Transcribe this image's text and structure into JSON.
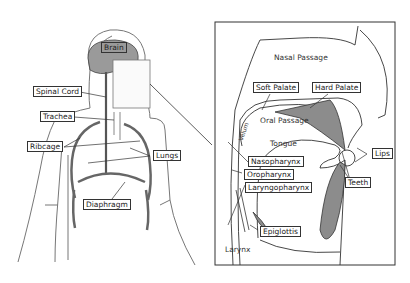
{
  "left_panel": {
    "labels": {
      "brain": "Brain",
      "spinal_cord": "Spinal Cord",
      "trachea": "Trachea",
      "ribcage": "Ribcage",
      "lungs": "Lungs",
      "diaphragm": "Diaphragm"
    }
  },
  "right_panel": {
    "labels": {
      "nasal_passage": "Nasal Passage",
      "soft_palate": "Soft Palate",
      "hard_palate": "Hard Palate",
      "velum": "Velum",
      "oral_passage": "Oral Passage",
      "tongue": "Tongue",
      "lips": "Lips",
      "nasopharynx": "Nasopharynx",
      "oropharynx": "Oropharynx",
      "teeth": "Teeth",
      "laryngopharynx": "Laryngopharynx",
      "epiglottis": "Epiglottis",
      "larynx": "Larynx"
    }
  },
  "colors": {
    "fill_grey": "#8c8c8c",
    "stroke": "#333333",
    "body_outline": "#777777"
  }
}
